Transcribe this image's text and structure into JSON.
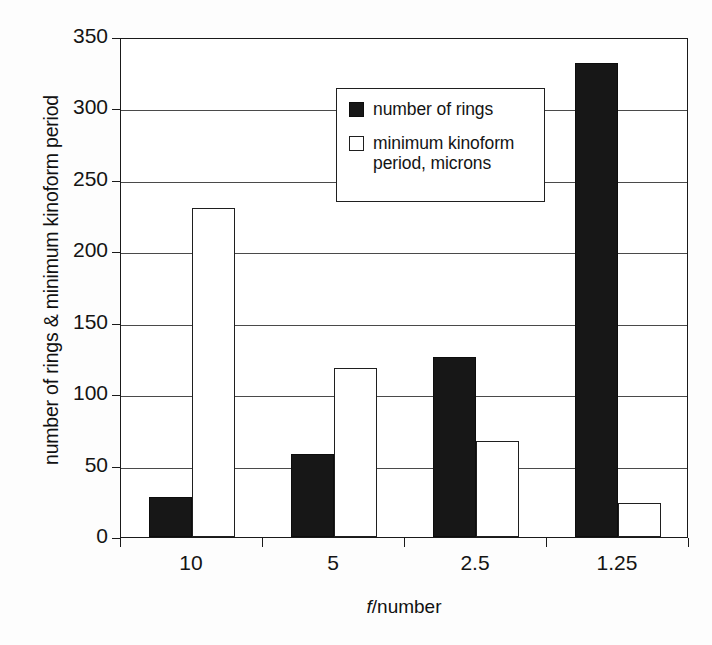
{
  "chart_data": {
    "type": "bar",
    "title": "",
    "xlabel": "f/number",
    "ylabel": "number of rings & minimum kinoform period",
    "categories": [
      "10",
      "5",
      "2.5",
      "1.25"
    ],
    "series": [
      {
        "name": "number of rings",
        "values": [
          28,
          58,
          126,
          332
        ],
        "color": "#171717",
        "style": "filled"
      },
      {
        "name": "minimum kinoform period, microns",
        "values": [
          230,
          118,
          67,
          24
        ],
        "color": "#ffffff",
        "style": "outlined"
      }
    ],
    "ylim": [
      0,
      350
    ],
    "yticks": [
      0,
      50,
      100,
      150,
      200,
      250,
      300,
      350
    ],
    "ytick_labels": [
      "0",
      "50",
      "100",
      "150",
      "200",
      "250",
      "300",
      "350"
    ],
    "grid": true,
    "legend_position": "upper-center"
  },
  "legend": {
    "entries": [
      {
        "label": "number of rings",
        "swatch": "filled-black-square"
      },
      {
        "label": "minimum kinoform",
        "label_line2": "period, microns",
        "swatch": "empty-white-square"
      }
    ]
  },
  "axis": {
    "xlabel_prefix": "f",
    "xlabel_suffix": "/number"
  }
}
